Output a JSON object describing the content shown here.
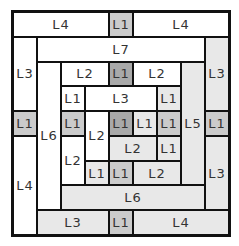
{
  "diagram": {
    "title": "",
    "grid": {
      "cols": 9,
      "rows": 9
    },
    "colors": {
      "white": "#ffffff",
      "light": "#e8e8e8",
      "mid": "#cbcbcb",
      "dark": "#a9a9a9",
      "border": "#111111"
    },
    "pieces": [
      {
        "label": "L4",
        "col": 0,
        "row": 0,
        "w": 4,
        "h": 1,
        "fill": "white"
      },
      {
        "label": "L1",
        "col": 4,
        "row": 0,
        "w": 1,
        "h": 1,
        "fill": "mid"
      },
      {
        "label": "L4",
        "col": 5,
        "row": 0,
        "w": 4,
        "h": 1,
        "fill": "white"
      },
      {
        "label": "L3",
        "col": 0,
        "row": 1,
        "w": 1,
        "h": 3,
        "fill": "white"
      },
      {
        "label": "L7",
        "col": 1,
        "row": 1,
        "w": 7,
        "h": 1,
        "fill": "white"
      },
      {
        "label": "L3",
        "col": 8,
        "row": 1,
        "w": 1,
        "h": 3,
        "fill": "light"
      },
      {
        "label": "L1",
        "col": 0,
        "row": 4,
        "w": 1,
        "h": 1,
        "fill": "mid"
      },
      {
        "label": "L1",
        "col": 8,
        "row": 4,
        "w": 1,
        "h": 1,
        "fill": "mid"
      },
      {
        "label": "L4",
        "col": 0,
        "row": 5,
        "w": 1,
        "h": 4,
        "fill": "white"
      },
      {
        "label": "L3",
        "col": 8,
        "row": 5,
        "w": 1,
        "h": 3,
        "fill": "light"
      },
      {
        "label": "L6",
        "col": 1,
        "row": 2,
        "w": 1,
        "h": 6,
        "fill": "white"
      },
      {
        "label": "L2",
        "col": 2,
        "row": 2,
        "w": 2,
        "h": 1,
        "fill": "white"
      },
      {
        "label": "L1",
        "col": 4,
        "row": 2,
        "w": 1,
        "h": 1,
        "fill": "dark"
      },
      {
        "label": "L2",
        "col": 5,
        "row": 2,
        "w": 2,
        "h": 1,
        "fill": "white"
      },
      {
        "label": "L5",
        "col": 7,
        "row": 2,
        "w": 1,
        "h": 5,
        "fill": "light"
      },
      {
        "label": "L1",
        "col": 2,
        "row": 3,
        "w": 1,
        "h": 1,
        "fill": "white"
      },
      {
        "label": "L3",
        "col": 3,
        "row": 3,
        "w": 3,
        "h": 1,
        "fill": "white"
      },
      {
        "label": "L1",
        "col": 6,
        "row": 3,
        "w": 1,
        "h": 1,
        "fill": "light"
      },
      {
        "label": "L1",
        "col": 2,
        "row": 4,
        "w": 1,
        "h": 1,
        "fill": "mid"
      },
      {
        "label": "L2",
        "col": 3,
        "row": 4,
        "w": 1,
        "h": 2,
        "fill": "white"
      },
      {
        "label": "L1",
        "col": 4,
        "row": 4,
        "w": 1,
        "h": 1,
        "fill": "dark"
      },
      {
        "label": "L1",
        "col": 5,
        "row": 4,
        "w": 1,
        "h": 1,
        "fill": "light"
      },
      {
        "label": "L1",
        "col": 6,
        "row": 4,
        "w": 1,
        "h": 1,
        "fill": "mid"
      },
      {
        "label": "L2",
        "col": 2,
        "row": 5,
        "w": 1,
        "h": 2,
        "fill": "white"
      },
      {
        "label": "L2",
        "col": 4,
        "row": 5,
        "w": 2,
        "h": 1,
        "fill": "light"
      },
      {
        "label": "L1",
        "col": 6,
        "row": 5,
        "w": 1,
        "h": 1,
        "fill": "light"
      },
      {
        "label": "L1",
        "col": 3,
        "row": 6,
        "w": 1,
        "h": 1,
        "fill": "light"
      },
      {
        "label": "L1",
        "col": 4,
        "row": 6,
        "w": 1,
        "h": 1,
        "fill": "mid"
      },
      {
        "label": "L2",
        "col": 5,
        "row": 6,
        "w": 2,
        "h": 1,
        "fill": "light"
      },
      {
        "label": "L6",
        "col": 2,
        "row": 7,
        "w": 6,
        "h": 1,
        "fill": "light"
      },
      {
        "label": "L3",
        "col": 1,
        "row": 8,
        "w": 3,
        "h": 1,
        "fill": "light"
      },
      {
        "label": "L1",
        "col": 4,
        "row": 8,
        "w": 1,
        "h": 1,
        "fill": "mid"
      },
      {
        "label": "L4",
        "col": 5,
        "row": 8,
        "w": 4,
        "h": 1,
        "fill": "light"
      }
    ]
  }
}
